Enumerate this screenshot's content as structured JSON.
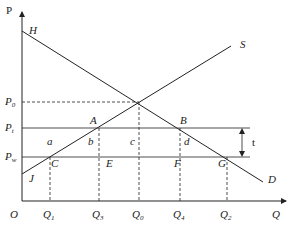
{
  "diagram": {
    "axes": {
      "y_label": "P",
      "x_label": "Q",
      "origin_label": "O"
    },
    "price_levels": [
      {
        "name": "P0",
        "base": "P",
        "sub": "0",
        "y": 102,
        "style": "dashed"
      },
      {
        "name": "Pt",
        "base": "P",
        "sub": "t",
        "y": 128,
        "style": "solid"
      },
      {
        "name": "Pw",
        "base": "P",
        "sub": "w",
        "y": 157,
        "style": "solid"
      }
    ],
    "quantities": [
      {
        "name": "Q1",
        "base": "Q",
        "sub": "1",
        "x": 50
      },
      {
        "name": "Q3",
        "base": "Q",
        "sub": "3",
        "x": 99
      },
      {
        "name": "Q0",
        "base": "Q",
        "sub": "0",
        "x": 139
      },
      {
        "name": "Q4",
        "base": "Q",
        "sub": "4",
        "x": 180
      },
      {
        "name": "Q2",
        "base": "Q",
        "sub": "2",
        "x": 227
      }
    ],
    "curves": {
      "demand": {
        "start_label": "H",
        "end_label": "D"
      },
      "supply": {
        "start_label": "J",
        "end_label": "S"
      }
    },
    "points": [
      "A",
      "B",
      "C",
      "E",
      "F",
      "G"
    ],
    "areas": [
      "a",
      "b",
      "c",
      "d"
    ],
    "tariff_label": "t"
  }
}
